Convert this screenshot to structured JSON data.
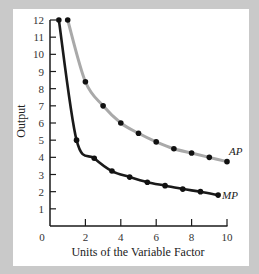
{
  "chart_data": {
    "type": "line",
    "title": "",
    "xlabel": "Units of the Variable Factor",
    "ylabel": "Output",
    "xlim": [
      0,
      10
    ],
    "ylim": [
      0,
      12
    ],
    "x_ticks": [
      0,
      2,
      4,
      6,
      8,
      10
    ],
    "y_ticks": [
      1,
      2,
      3,
      4,
      5,
      6,
      7,
      8,
      9,
      10,
      11,
      12
    ],
    "grid": false,
    "legend_position": "inline-right",
    "series": [
      {
        "name": "AP",
        "color": "#a9a9a9",
        "marker_color": "#111111",
        "x": [
          1,
          2,
          3,
          4,
          5,
          6,
          7,
          8,
          9,
          10
        ],
        "y": [
          12,
          8.4,
          7.0,
          6.0,
          5.4,
          4.9,
          4.5,
          4.25,
          4.0,
          3.75
        ]
      },
      {
        "name": "MP",
        "color": "#1a1a1a",
        "marker_color": "#111111",
        "x": [
          0.5,
          1.5,
          2.5,
          3.5,
          4.5,
          5.5,
          6.5,
          7.5,
          8.5,
          9.5
        ],
        "y": [
          12,
          5.0,
          3.95,
          3.2,
          2.85,
          2.55,
          2.35,
          2.15,
          2.0,
          1.8
        ]
      }
    ]
  },
  "labels": {
    "origin": "0",
    "ap": "AP",
    "mp": "MP"
  },
  "colors": {
    "background": "#c9c9c9",
    "panel": "#ffffff",
    "axis": "#1a1a1a"
  }
}
